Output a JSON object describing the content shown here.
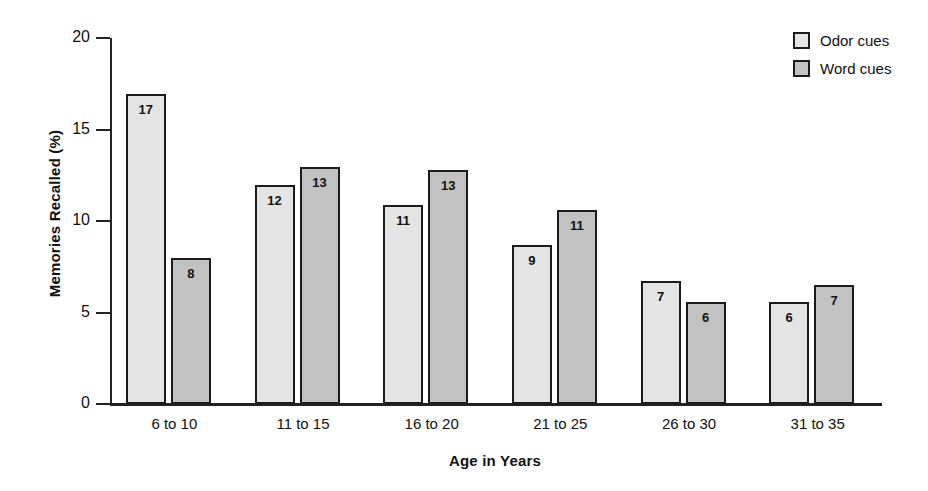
{
  "chart_data": {
    "type": "bar",
    "title": "",
    "subtitle": "",
    "xlabel": "Age in Years",
    "ylabel": "Memories Recalled (%)",
    "categories": [
      "6 to 10",
      "11 to 15",
      "16 to 20",
      "21 to 25",
      "26 to 30",
      "31 to 35"
    ],
    "series": [
      {
        "name": "Odor cues",
        "color": "#e4e4e4",
        "values": [
          17,
          12,
          11,
          9,
          7,
          6
        ],
        "bar_heights": [
          16.95,
          11.95,
          10.85,
          8.7,
          6.7,
          5.6
        ]
      },
      {
        "name": "Word cues",
        "color": "#c2c2c2",
        "values": [
          8,
          13,
          13,
          11,
          6,
          7
        ],
        "bar_heights": [
          8.0,
          12.95,
          12.8,
          10.6,
          5.6,
          6.5
        ]
      }
    ],
    "ylim": [
      0,
      20
    ],
    "yticks": [
      0,
      5,
      10,
      15,
      20
    ],
    "ytick_labels": [
      "0",
      "5",
      "10",
      "15",
      "20"
    ],
    "grid": false,
    "legend_position": "top-right",
    "value_labels_inside_bars": true
  },
  "legend": {
    "items": [
      {
        "label": "Odor cues",
        "swatch": "odor"
      },
      {
        "label": "Word cues",
        "swatch": "word"
      }
    ]
  }
}
